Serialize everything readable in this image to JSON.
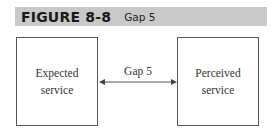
{
  "figure": {
    "number": "FIGURE 8-8",
    "title": "Gap 5"
  },
  "diagram": {
    "left_box": {
      "line1": "Expected",
      "line2": "service"
    },
    "right_box": {
      "line1": "Perceived",
      "line2": "service"
    },
    "connector": {
      "label": "Gap 5",
      "type": "double-headed-arrow"
    },
    "colors": {
      "header_bg": "#c9c9c9",
      "stroke": "#555555"
    }
  }
}
